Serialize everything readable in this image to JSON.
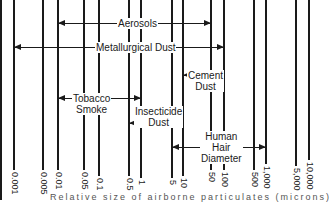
{
  "diagram": {
    "axis": {
      "scale": "logarithmic",
      "ticks": [
        {
          "label": "0.001",
          "x": 14,
          "bottom": 170
        },
        {
          "label": "0.005",
          "x": 43,
          "bottom": 170
        },
        {
          "label": "0.01",
          "x": 58,
          "bottom": 170
        },
        {
          "label": "0.05",
          "x": 84,
          "bottom": 170
        },
        {
          "label": "0.1",
          "x": 99,
          "bottom": 176
        },
        {
          "label": "0.5",
          "x": 129,
          "bottom": 176
        },
        {
          "label": "1",
          "x": 141,
          "bottom": 178
        },
        {
          "label": "5",
          "x": 172,
          "bottom": 178
        },
        {
          "label": "10",
          "x": 183,
          "bottom": 176
        },
        {
          "label": "50",
          "x": 211,
          "bottom": 170
        },
        {
          "label": "100",
          "x": 224,
          "bottom": 170
        },
        {
          "label": "500",
          "x": 254,
          "bottom": 170
        },
        {
          "label": "1,000",
          "x": 266,
          "bottom": 164
        },
        {
          "label": "5,000",
          "x": 296,
          "bottom": 166
        },
        {
          "label": "10,000",
          "x": 309,
          "bottom": 160
        }
      ]
    },
    "ranges": [
      {
        "label": "Aerosols",
        "from": "0.01",
        "to": "50",
        "x1": 58,
        "x2": 211,
        "y": 23,
        "label_x": 117,
        "label_y": 18
      },
      {
        "label": "Metallurgical Dust",
        "from": "0.001",
        "to": "100",
        "x1": 14,
        "x2": 224,
        "y": 47,
        "label_x": 95,
        "label_y": 42
      },
      {
        "label": "Cement\nDust",
        "from": "10",
        "to": "100",
        "x1": 183,
        "x2": 224,
        "y": 75,
        "label_x": 187,
        "label_y": 70
      },
      {
        "label": "Tobacco\nSmoke",
        "from": "0.01",
        "to": "1",
        "x1": 58,
        "x2": 141,
        "y": 98,
        "label_x": 72,
        "label_y": 93
      },
      {
        "label": "Insecticide\nDust",
        "from": "0.5",
        "to": "10",
        "x1": 129,
        "x2": 183,
        "y": 123,
        "label_x": 134,
        "label_y": 106
      },
      {
        "label": "Human\nHair\nDiameter",
        "from": "5",
        "to": "1,000",
        "x1": 172,
        "x2": 266,
        "y": 147,
        "label_x": 200,
        "label_y": 131
      }
    ],
    "caption": "Relative size of airborne particulates (microns)"
  }
}
